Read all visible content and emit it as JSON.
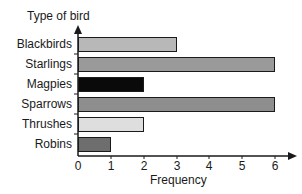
{
  "chart_data": {
    "type": "bar",
    "orientation": "horizontal",
    "title": "",
    "ylabel": "Type of bird",
    "xlabel": "Frequency",
    "categories": [
      "Blackbirds",
      "Starlings",
      "Magpies",
      "Sparrows",
      "Thrushes",
      "Robins"
    ],
    "values": [
      3,
      6,
      2,
      6,
      2,
      1
    ],
    "bar_colors": [
      "#b8b8b8",
      "#9a9a9a",
      "#0a0a0a",
      "#8e8e8e",
      "#dedede",
      "#6e6e6e"
    ],
    "xlim": [
      0,
      6
    ],
    "xticks": [
      "0",
      "1",
      "2",
      "3",
      "4",
      "5",
      "6"
    ],
    "grid": false,
    "legend": null
  }
}
